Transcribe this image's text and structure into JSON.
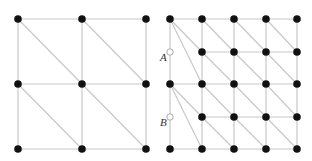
{
  "diagram": {
    "colors": {
      "edge": "#c8c8c8",
      "node": "#111111",
      "hanging_node_stroke": "#aaaaaa"
    },
    "left_mesh": {
      "nodes": [
        [
          18,
          19
        ],
        [
          82,
          19
        ],
        [
          146,
          19
        ],
        [
          18,
          84
        ],
        [
          82,
          84
        ],
        [
          146,
          84
        ],
        [
          18,
          149
        ],
        [
          82,
          149
        ],
        [
          146,
          149
        ]
      ],
      "edges": [
        [
          [
            18,
            19
          ],
          [
            146,
            19
          ]
        ],
        [
          [
            18,
            84
          ],
          [
            146,
            84
          ]
        ],
        [
          [
            18,
            149
          ],
          [
            146,
            149
          ]
        ],
        [
          [
            18,
            19
          ],
          [
            18,
            149
          ]
        ],
        [
          [
            82,
            19
          ],
          [
            82,
            149
          ]
        ],
        [
          [
            146,
            19
          ],
          [
            146,
            149
          ]
        ],
        [
          [
            18,
            19
          ],
          [
            82,
            84
          ]
        ],
        [
          [
            82,
            19
          ],
          [
            146,
            84
          ]
        ],
        [
          [
            18,
            84
          ],
          [
            82,
            149
          ]
        ],
        [
          [
            82,
            84
          ],
          [
            146,
            149
          ]
        ]
      ]
    },
    "right_mesh": {
      "nodes": [
        [
          170,
          19
        ],
        [
          202,
          19
        ],
        [
          234,
          19
        ],
        [
          266,
          19
        ],
        [
          297,
          19
        ],
        [
          202,
          52
        ],
        [
          234,
          52
        ],
        [
          266,
          52
        ],
        [
          297,
          52
        ],
        [
          170,
          84
        ],
        [
          202,
          84
        ],
        [
          234,
          84
        ],
        [
          266,
          84
        ],
        [
          297,
          84
        ],
        [
          202,
          117
        ],
        [
          234,
          117
        ],
        [
          266,
          117
        ],
        [
          297,
          117
        ],
        [
          170,
          149
        ],
        [
          202,
          149
        ],
        [
          234,
          149
        ],
        [
          266,
          149
        ],
        [
          297,
          149
        ]
      ],
      "hanging_nodes": [
        {
          "label": "A",
          "x": 170,
          "y": 52,
          "label_x": 160,
          "label_y": 60
        },
        {
          "label": "B",
          "x": 170,
          "y": 117,
          "label_x": 160,
          "label_y": 125
        }
      ],
      "edges": [
        [
          [
            170,
            19
          ],
          [
            297,
            19
          ]
        ],
        [
          [
            202,
            52
          ],
          [
            297,
            52
          ]
        ],
        [
          [
            170,
            84
          ],
          [
            297,
            84
          ]
        ],
        [
          [
            202,
            117
          ],
          [
            297,
            117
          ]
        ],
        [
          [
            170,
            149
          ],
          [
            297,
            149
          ]
        ],
        [
          [
            170,
            19
          ],
          [
            170,
            149
          ]
        ],
        [
          [
            202,
            19
          ],
          [
            202,
            149
          ]
        ],
        [
          [
            234,
            19
          ],
          [
            234,
            149
          ]
        ],
        [
          [
            266,
            19
          ],
          [
            266,
            149
          ]
        ],
        [
          [
            297,
            19
          ],
          [
            297,
            149
          ]
        ],
        [
          [
            170,
            19
          ],
          [
            202,
            52
          ]
        ],
        [
          [
            170,
            19
          ],
          [
            202,
            84
          ]
        ],
        [
          [
            170,
            84
          ],
          [
            202,
            117
          ]
        ],
        [
          [
            170,
            84
          ],
          [
            202,
            149
          ]
        ],
        [
          [
            202,
            19
          ],
          [
            234,
            52
          ]
        ],
        [
          [
            234,
            19
          ],
          [
            266,
            52
          ]
        ],
        [
          [
            266,
            19
          ],
          [
            297,
            52
          ]
        ],
        [
          [
            202,
            52
          ],
          [
            234,
            84
          ]
        ],
        [
          [
            234,
            52
          ],
          [
            266,
            84
          ]
        ],
        [
          [
            266,
            52
          ],
          [
            297,
            84
          ]
        ],
        [
          [
            202,
            84
          ],
          [
            234,
            117
          ]
        ],
        [
          [
            234,
            84
          ],
          [
            266,
            117
          ]
        ],
        [
          [
            266,
            84
          ],
          [
            297,
            117
          ]
        ],
        [
          [
            202,
            117
          ],
          [
            234,
            149
          ]
        ],
        [
          [
            234,
            117
          ],
          [
            266,
            149
          ]
        ],
        [
          [
            266,
            117
          ],
          [
            297,
            149
          ]
        ]
      ]
    },
    "labels": {
      "a": "A",
      "b": "B"
    }
  }
}
